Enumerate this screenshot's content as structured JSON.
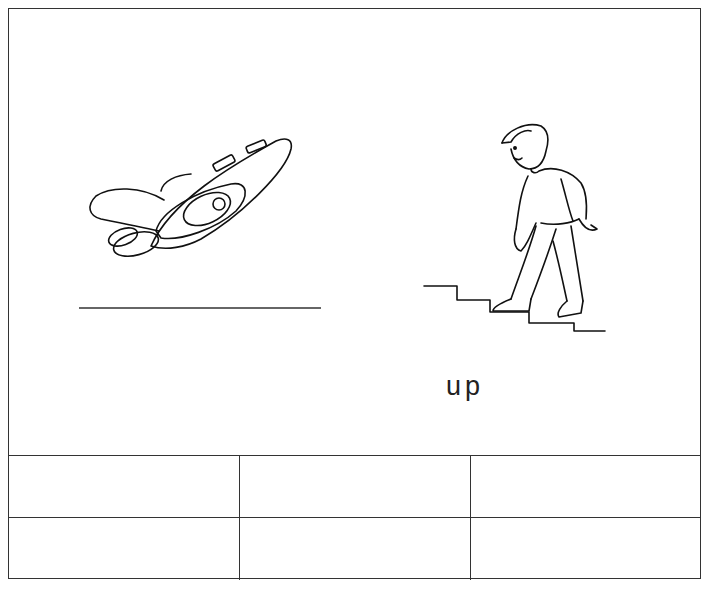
{
  "worksheet": {
    "pictures": [
      {
        "name": "airplane-taking-off",
        "label_line": "blank",
        "word": ""
      },
      {
        "name": "boy-walking-down-stairs",
        "word": "up"
      }
    ],
    "word_label": "up",
    "answer_grid": {
      "rows": 2,
      "columns": 3,
      "cells": [
        [
          "",
          "",
          ""
        ],
        [
          "",
          "",
          ""
        ]
      ]
    }
  }
}
